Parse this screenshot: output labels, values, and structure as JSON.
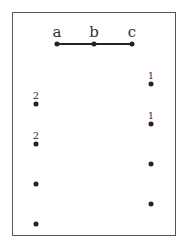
{
  "diagram": {
    "path": {
      "nodes": [
        {
          "label": "a",
          "x": 57,
          "y": 44
        },
        {
          "label": "b",
          "x": 94,
          "y": 44
        },
        {
          "label": "c",
          "x": 132,
          "y": 44
        }
      ]
    },
    "left_column": [
      {
        "label": "2",
        "x": 36,
        "y": 104
      },
      {
        "label": "2",
        "x": 36,
        "y": 144
      },
      {
        "label": "",
        "x": 36,
        "y": 184
      },
      {
        "label": "",
        "x": 36,
        "y": 224
      }
    ],
    "right_column": [
      {
        "label": "1",
        "x": 151,
        "y": 84
      },
      {
        "label": "1",
        "x": 151,
        "y": 124
      },
      {
        "label": "",
        "x": 151,
        "y": 164
      },
      {
        "label": "",
        "x": 151,
        "y": 204
      }
    ]
  }
}
